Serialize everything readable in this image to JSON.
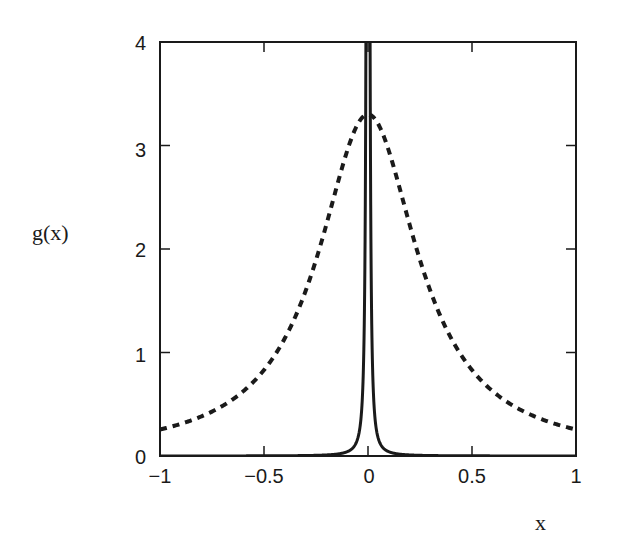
{
  "chart_data": {
    "type": "line",
    "title": "",
    "xlabel": "x",
    "ylabel": "g(x)",
    "xlim": [
      -1,
      1
    ],
    "ylim": [
      0,
      4
    ],
    "grid": false,
    "legend": null,
    "x_ticks": [
      "-1",
      "-0.5",
      "0",
      "0.5",
      "1"
    ],
    "y_ticks": [
      "0",
      "1",
      "2",
      "3",
      "4"
    ],
    "series": [
      {
        "name": "broad Lorentzian (dashed)",
        "style": "dashed",
        "color": "#1a1a1a",
        "x": [
          -1,
          -0.9,
          -0.8,
          -0.7,
          -0.6,
          -0.5,
          -0.4,
          -0.3,
          -0.2,
          -0.1,
          0,
          0.1,
          0.2,
          0.3,
          0.4,
          0.5,
          0.6,
          0.7,
          0.8,
          0.9,
          1
        ],
        "values": [
          0.26,
          0.31,
          0.38,
          0.48,
          0.63,
          0.83,
          1.14,
          1.59,
          2.24,
          2.95,
          3.3,
          2.95,
          2.24,
          1.59,
          1.14,
          0.83,
          0.63,
          0.48,
          0.38,
          0.31,
          0.26
        ]
      },
      {
        "name": "narrow Lorentzian (solid)",
        "style": "solid",
        "color": "#1a1a1a",
        "note": "very narrow peak centered at x=0, extends beyond y=4",
        "x": [
          -1,
          -0.5,
          -0.1,
          -0.05,
          -0.04,
          -0.02,
          -0.01,
          0,
          0.01,
          0.02,
          0.04,
          0.05,
          0.1,
          0.5,
          1
        ],
        "values": [
          0.0,
          0.0,
          0.03,
          0.1,
          0.26,
          1.0,
          3.9,
          245,
          3.9,
          1.0,
          0.26,
          0.1,
          0.03,
          0.0,
          0.0
        ]
      }
    ]
  },
  "axes": {
    "xlabel": "x",
    "ylabel": "g(x)",
    "x_tick_labels": [
      "−1",
      "−0.5",
      "0",
      "0.5",
      "1"
    ],
    "y_tick_labels": [
      "0",
      "1",
      "2",
      "3",
      "4"
    ]
  }
}
